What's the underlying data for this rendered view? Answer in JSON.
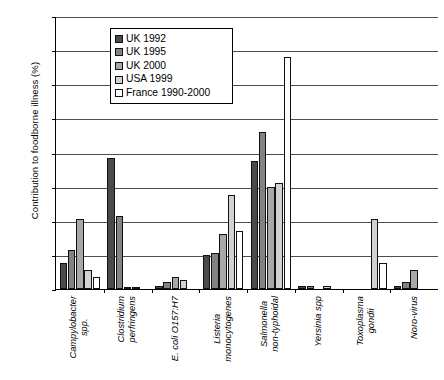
{
  "chart_data": {
    "type": "bar",
    "title": "",
    "xlabel": "",
    "ylabel": "Contribution to foodborne illness (%)",
    "ylim": [
      0,
      80
    ],
    "ytick_step": 10,
    "yticks": [
      80,
      70,
      60,
      50,
      40,
      30,
      20,
      10,
      0
    ],
    "grid": "horizontal",
    "legend_position": "upper-left-inside",
    "categories": [
      "Campylobacter spp.",
      "Clostridium perfringens",
      "E. coli O157:H7",
      "Listeria monocytogenes",
      "Salmonella non-typhoidal",
      "Yersinia spp",
      "Toxoplasma gondii",
      "Noro-virus"
    ],
    "series": [
      {
        "name": "UK 1992",
        "color": "#4a4a4a",
        "values": [
          7.5,
          38.5,
          1.0,
          10.0,
          37.5,
          1.0,
          0.0,
          1.0
        ]
      },
      {
        "name": "UK 1995",
        "color": "#838383",
        "values": [
          11.5,
          21.5,
          2.0,
          10.5,
          46.0,
          1.0,
          0.0,
          2.0
        ]
      },
      {
        "name": "UK 2000",
        "color": "#a8a8a8",
        "values": [
          20.5,
          0.5,
          3.5,
          16.0,
          30.0,
          0.0,
          0.0,
          5.5
        ]
      },
      {
        "name": "USA 1999",
        "color": "#d2d2d2",
        "values": [
          5.5,
          0.5,
          2.5,
          27.5,
          31.0,
          1.0,
          20.5,
          0.0
        ]
      },
      {
        "name": "France 1990-2000",
        "color": "#ffffff",
        "values": [
          3.5,
          0.0,
          0.0,
          17.0,
          68.0,
          0.0,
          7.5,
          0.0
        ]
      }
    ]
  }
}
